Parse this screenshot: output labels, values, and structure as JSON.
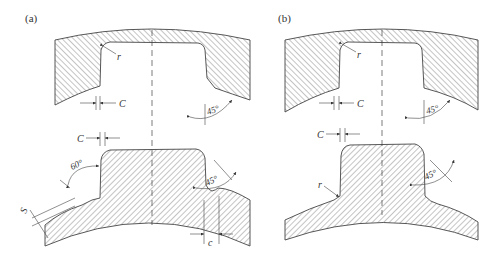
{
  "figure": {
    "panels": [
      {
        "id": "a",
        "label": "(a)",
        "upper_part": {
          "labels": {
            "radius": "r",
            "clearance": "C",
            "angle": "45°"
          }
        },
        "lower_part": {
          "labels": {
            "clearance": "C",
            "angle_left": "60°",
            "angle_right": "45°",
            "thickness": "S",
            "width": "c"
          }
        }
      },
      {
        "id": "b",
        "label": "(b)",
        "upper_part": {
          "labels": {
            "radius": "r",
            "clearance": "C",
            "angle": "45°"
          }
        },
        "lower_part": {
          "labels": {
            "clearance": "C",
            "radius": "r",
            "angle": "45°"
          }
        }
      }
    ],
    "colors": {
      "line": "#444444",
      "text": "#333333",
      "background": "#ffffff"
    }
  }
}
